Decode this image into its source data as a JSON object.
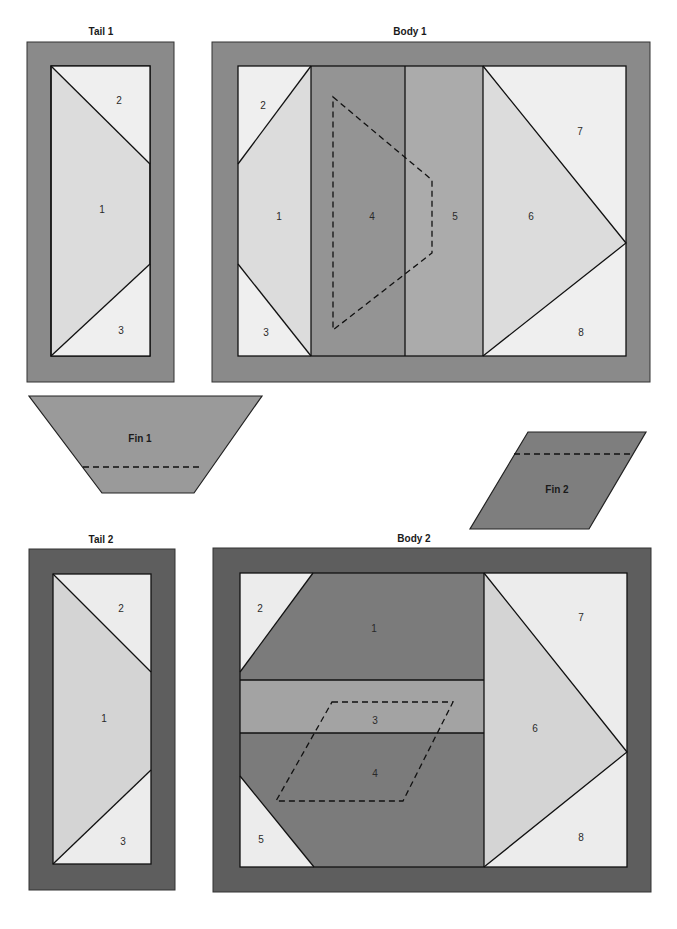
{
  "colors": {
    "border_medium": "#8a8a8a",
    "border_dark": "#5e5e5e",
    "fill_lightest": "#efefef",
    "fill_light": "#dcdcdc",
    "fill_mid": "#a9a9a9",
    "fill_dark": "#8e8e8e",
    "fill_darker": "#7b7b7b",
    "fin1": "#9a9a9a",
    "fin2": "#7e7e7e"
  },
  "blocks": {
    "tail1": {
      "title": "Tail 1",
      "pieces": [
        "1",
        "2",
        "3"
      ]
    },
    "body1": {
      "title": "Body 1",
      "pieces": [
        "1",
        "2",
        "3",
        "4",
        "5",
        "6",
        "7",
        "8"
      ]
    },
    "fin1": {
      "title": "Fin 1"
    },
    "fin2": {
      "title": "Fin 2"
    },
    "tail2": {
      "title": "Tail 2",
      "pieces": [
        "1",
        "2",
        "3"
      ]
    },
    "body2": {
      "title": "Body 2",
      "pieces": [
        "1",
        "2",
        "3",
        "4",
        "5",
        "6",
        "7",
        "8"
      ]
    }
  }
}
